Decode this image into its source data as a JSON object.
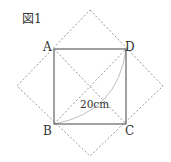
{
  "figure": {
    "title": "図1",
    "labels": {
      "A": "A",
      "B": "B",
      "C": "C",
      "D": "D"
    },
    "measurement": "20cm",
    "colors": {
      "solid": "#555555",
      "dashed": "#888888",
      "arc": "#aaaaaa"
    }
  }
}
